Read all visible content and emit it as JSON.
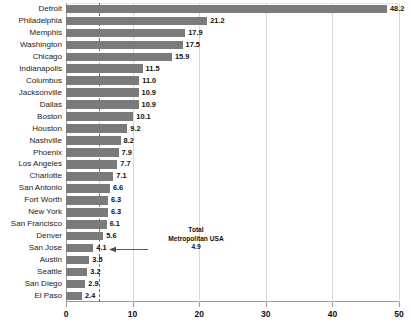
{
  "chart_data": {
    "type": "bar",
    "orientation": "horizontal",
    "title": "",
    "xlabel": "",
    "ylabel": "",
    "xlim": [
      0,
      50
    ],
    "grid": true,
    "grid_axis": "x",
    "legend": "none",
    "bar_color": "#7b7b7b",
    "categories": [
      "Detroit",
      "Philadelphia",
      "Memphis",
      "Washington",
      "Chicago",
      "Indianapolis",
      "Columbus",
      "Jacksonville",
      "Dallas",
      "Boston",
      "Houston",
      "Nashville",
      "Phoenix",
      "Los Angeles",
      "Charlotte",
      "San Antonio",
      "Fort Worth",
      "New York",
      "San Francisco",
      "Denver",
      "San Jose",
      "Austin",
      "Seattle",
      "San Diego",
      "El Paso"
    ],
    "values": [
      48.2,
      21.2,
      17.9,
      17.5,
      15.9,
      11.5,
      11.0,
      10.9,
      10.9,
      10.1,
      9.2,
      8.2,
      7.9,
      7.7,
      7.1,
      6.6,
      6.3,
      6.3,
      6.1,
      5.6,
      4.1,
      3.5,
      3.2,
      2.9,
      2.4
    ],
    "value_labels": [
      "48.2",
      "21.2",
      "17.9",
      "17.5",
      "15.9",
      "11.5",
      "11.0",
      "10.9",
      "10.9",
      "10.1",
      "9.2",
      "8.2",
      "7.9",
      "7.7",
      "7.1",
      "6.6",
      "6.3",
      "6.3",
      "6.1",
      "5.6",
      "4.1",
      "3.5",
      "3.2",
      "2.9",
      "2.4"
    ],
    "xticks": [
      0,
      10,
      20,
      30,
      40,
      50
    ],
    "xtick_labels": [
      "0",
      "10",
      "20",
      "30",
      "40",
      "50"
    ],
    "reference_line": {
      "value": 4.9,
      "style": "dashed",
      "color": "#6e6e6e"
    },
    "annotations": [
      {
        "line1": "Total",
        "line2": "Metropolitan USA",
        "line3": "4.9",
        "points_to": 4.9,
        "arrow": "left"
      }
    ]
  }
}
